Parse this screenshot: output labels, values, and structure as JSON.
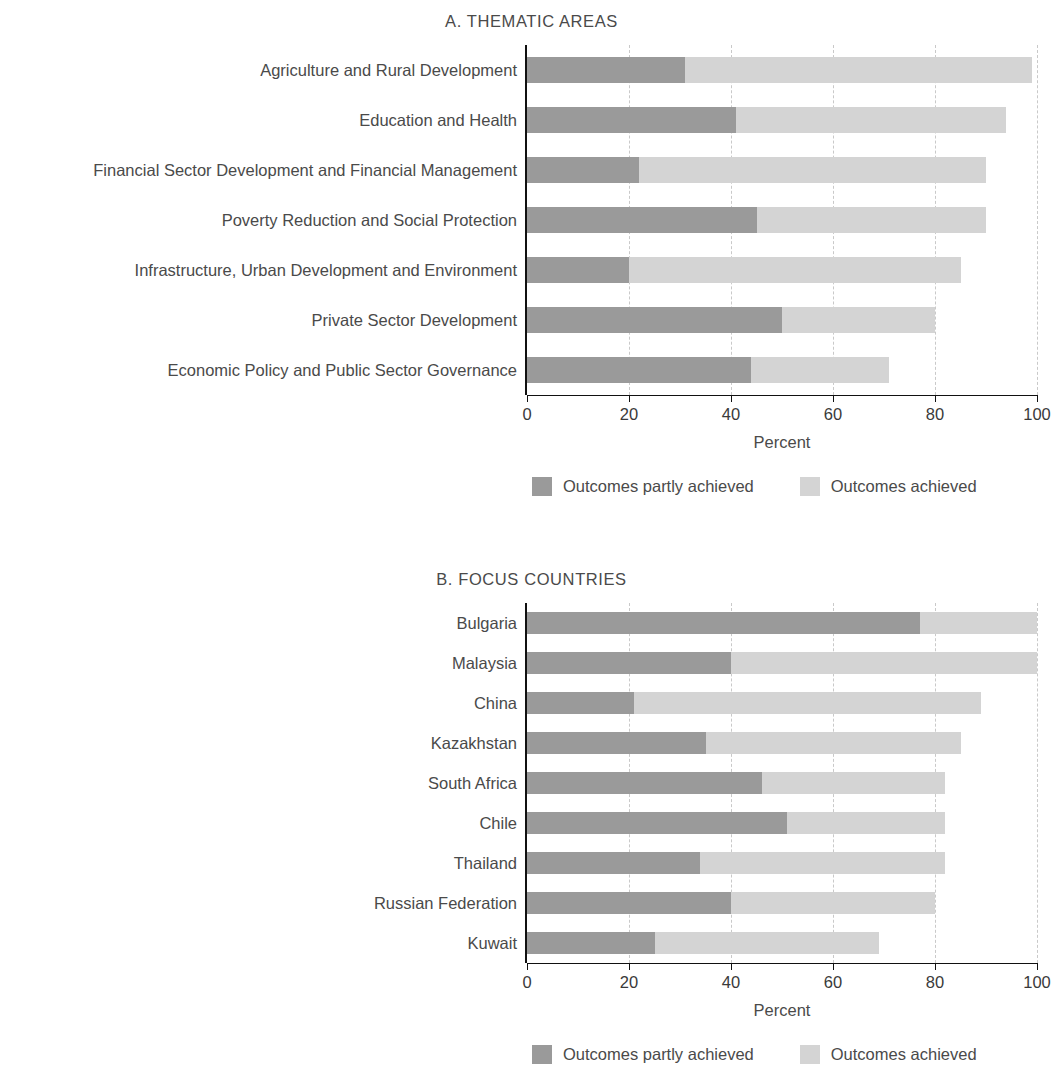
{
  "colors": {
    "partly_achieved": "#9a9a9a",
    "achieved": "#d4d4d4",
    "axis": "#111111",
    "gridline": "#c9c9c9",
    "text": "#4a4a4a"
  },
  "legend": {
    "partly_label": "Outcomes partly achieved",
    "achieved_label": "Outcomes achieved"
  },
  "axis": {
    "xlabel": "Percent",
    "ticks": [
      "0",
      "20",
      "40",
      "60",
      "80",
      "100"
    ]
  },
  "panel_a": {
    "title": "A. THEMATIC AREAS"
  },
  "panel_b": {
    "title": "B. FOCUS COUNTRIES"
  },
  "chart_data": [
    {
      "type": "bar",
      "orientation": "horizontal",
      "stacked": true,
      "title": "A. THEMATIC AREAS",
      "xlabel": "Percent",
      "ylabel": "",
      "xlim": [
        0,
        100
      ],
      "xticks": [
        0,
        20,
        40,
        60,
        80,
        100
      ],
      "grid": "vertical-dashed",
      "legend_position": "bottom",
      "categories": [
        "Agriculture and Rural Development",
        "Education and Health",
        "Financial Sector Development and Financial Management",
        "Poverty Reduction and Social Protection",
        "Infrastructure, Urban Development and Environment",
        "Private Sector Development",
        "Economic Policy and Public Sector Governance"
      ],
      "series": [
        {
          "name": "Outcomes partly achieved",
          "color": "#9a9a9a",
          "values": [
            31,
            41,
            22,
            45,
            20,
            50,
            44
          ]
        },
        {
          "name": "Outcomes achieved",
          "color": "#d4d4d4",
          "values": [
            68,
            53,
            68,
            45,
            65,
            30,
            27
          ]
        }
      ],
      "totals": [
        99,
        94,
        90,
        90,
        85,
        80,
        71
      ]
    },
    {
      "type": "bar",
      "orientation": "horizontal",
      "stacked": true,
      "title": "B. FOCUS COUNTRIES",
      "xlabel": "Percent",
      "ylabel": "",
      "xlim": [
        0,
        100
      ],
      "xticks": [
        0,
        20,
        40,
        60,
        80,
        100
      ],
      "grid": "vertical-dashed",
      "legend_position": "bottom",
      "categories": [
        "Bulgaria",
        "Malaysia",
        "China",
        "Kazakhstan",
        "South Africa",
        "Chile",
        "Thailand",
        "Russian Federation",
        "Kuwait"
      ],
      "series": [
        {
          "name": "Outcomes partly achieved",
          "color": "#9a9a9a",
          "values": [
            77,
            40,
            21,
            35,
            46,
            51,
            34,
            40,
            25
          ]
        },
        {
          "name": "Outcomes achieved",
          "color": "#d4d4d4",
          "values": [
            23,
            60,
            68,
            50,
            36,
            31,
            48,
            40,
            44
          ]
        }
      ],
      "totals": [
        100,
        100,
        89,
        85,
        82,
        82,
        82,
        80,
        69
      ]
    }
  ]
}
